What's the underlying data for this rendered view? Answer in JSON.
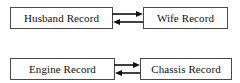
{
  "diagram": {
    "background_color": "#ffffff",
    "box_border_color": "#4a4a4a",
    "arrow_color": "#111111",
    "text_color": "#111111",
    "groups": [
      {
        "id": "marriage",
        "left_box": {
          "label": "Husband Record"
        },
        "right_box": {
          "label": "Wife Record"
        },
        "connector": {
          "type": "bidirectional-arrow-pair",
          "top_arrow_direction": "right",
          "bottom_arrow_direction": "left"
        }
      },
      {
        "id": "vehicle",
        "left_box": {
          "label": "Engine Record"
        },
        "right_box": {
          "label": "Chassis Record"
        },
        "connector": {
          "type": "bidirectional-arrow-pair",
          "top_arrow_direction": "right",
          "bottom_arrow_direction": "left"
        }
      }
    ]
  }
}
